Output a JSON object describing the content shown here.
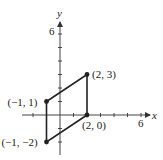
{
  "chart_data": {
    "type": "scatter",
    "title": "",
    "xlabel": "x",
    "ylabel": "y",
    "xlim": [
      -2,
      7
    ],
    "ylim": [
      -3,
      7
    ],
    "x_tick_label": "6",
    "y_tick_label": "6",
    "grid": false,
    "shape": "parallelogram",
    "points": [
      {
        "x": -1,
        "y": 1,
        "label": "(−1, 1)"
      },
      {
        "x": 2,
        "y": 3,
        "label": "(2, 3)"
      },
      {
        "x": 2,
        "y": 0,
        "label": "(2, 0)"
      },
      {
        "x": -1,
        "y": -2,
        "label": "(−1, −2)"
      }
    ],
    "line_color": "#222222"
  }
}
